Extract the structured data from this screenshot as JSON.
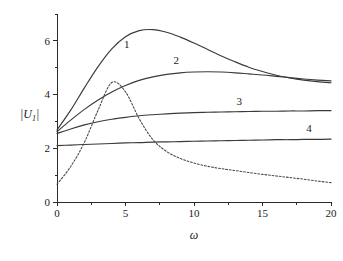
{
  "chart_data": {
    "type": "line",
    "title": "",
    "subtitle": "",
    "xlabel": "ω",
    "ylabel": "|U₁|",
    "xlim": [
      0,
      20
    ],
    "ylim": [
      0,
      7
    ],
    "grid": false,
    "legend_position": "inline-curve-labels",
    "xticks": [
      0,
      5,
      10,
      15,
      20
    ],
    "xtick_labels": [
      "0",
      "5",
      "10",
      "15",
      "20"
    ],
    "x_minor_ticks": [
      2.5,
      7.5,
      12.5,
      17.5
    ],
    "yticks": [
      0,
      2,
      4,
      6
    ],
    "ytick_labels": [
      "0",
      "2",
      "4",
      "6"
    ],
    "y_minor_ticks": [
      1,
      3,
      5,
      7
    ],
    "x": [
      0,
      1,
      2,
      3,
      4,
      5,
      6,
      7,
      8,
      9,
      10,
      11,
      12,
      13,
      14,
      15,
      16,
      17,
      18,
      19,
      20
    ],
    "series": [
      {
        "name": "1",
        "label": "1",
        "style": "solid",
        "color": "#3a3a3a",
        "label_x": 5.1,
        "label_y": 5.72,
        "values": [
          2.68,
          3.42,
          4.25,
          5.04,
          5.7,
          6.15,
          6.38,
          6.42,
          6.32,
          6.14,
          5.92,
          5.68,
          5.44,
          5.22,
          5.02,
          4.86,
          4.72,
          4.62,
          4.54,
          4.48,
          4.44
        ]
      },
      {
        "name": "2",
        "label": "2",
        "style": "solid",
        "color": "#3a3a3a",
        "label_x": 8.7,
        "label_y": 5.12,
        "values": [
          2.62,
          3.05,
          3.45,
          3.8,
          4.1,
          4.34,
          4.53,
          4.66,
          4.75,
          4.81,
          4.84,
          4.85,
          4.84,
          4.81,
          4.77,
          4.73,
          4.68,
          4.63,
          4.58,
          4.54,
          4.51
        ]
      },
      {
        "name": "3",
        "label": "3",
        "style": "solid",
        "color": "#3a3a3a",
        "label_x": 13.3,
        "label_y": 3.63,
        "values": [
          2.55,
          2.72,
          2.87,
          2.99,
          3.08,
          3.15,
          3.21,
          3.25,
          3.28,
          3.31,
          3.33,
          3.34,
          3.35,
          3.36,
          3.37,
          3.38,
          3.38,
          3.39,
          3.39,
          3.4,
          3.4
        ]
      },
      {
        "name": "4",
        "label": "4",
        "style": "solid",
        "color": "#3a3a3a",
        "label_x": 18.4,
        "label_y": 2.59,
        "values": [
          2.1,
          2.12,
          2.14,
          2.16,
          2.18,
          2.2,
          2.21,
          2.23,
          2.24,
          2.25,
          2.26,
          2.27,
          2.28,
          2.29,
          2.3,
          2.31,
          2.32,
          2.32,
          2.33,
          2.33,
          2.34
        ]
      },
      {
        "name": "resonance",
        "label": "",
        "style": "dashed",
        "color": "#4a4a4a",
        "values": [
          0.66,
          1.32,
          2.22,
          3.42,
          4.45,
          4.1,
          3.1,
          2.32,
          1.88,
          1.62,
          1.45,
          1.33,
          1.24,
          1.17,
          1.1,
          1.03,
          0.97,
          0.91,
          0.85,
          0.78,
          0.72
        ]
      }
    ]
  },
  "axes": {
    "y_axis_name": "magnitude-axis",
    "x_axis_name": "frequency-axis"
  }
}
